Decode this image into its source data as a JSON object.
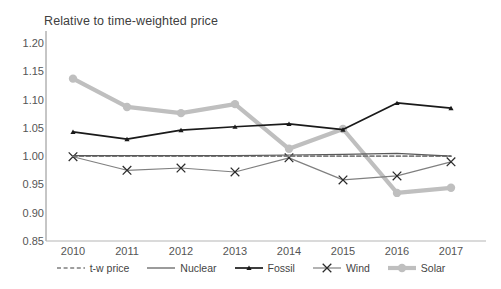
{
  "chart_data": {
    "type": "line",
    "title": "Relative to time-weighted price",
    "xlabel": "",
    "ylabel": "",
    "categories": [
      "2010",
      "2011",
      "2012",
      "2013",
      "2014",
      "2015",
      "2016",
      "2017"
    ],
    "x": [
      2010,
      2011,
      2012,
      2013,
      2014,
      2015,
      2016,
      2017
    ],
    "ylim": [
      0.85,
      1.2
    ],
    "ytick_labels": [
      "1.20",
      "1.15",
      "1.10",
      "1.05",
      "1.00",
      "0.95",
      "0.90",
      "0.85"
    ],
    "yticks": [
      1.2,
      1.15,
      1.1,
      1.05,
      1.0,
      0.95,
      0.9,
      0.85
    ],
    "grid": false,
    "legend_position": "bottom",
    "series": [
      {
        "name": "t-w price",
        "style": "dashed",
        "color": "#7f7f7f",
        "marker": "none",
        "values": [
          1.0,
          1.0,
          1.0,
          1.0,
          1.0,
          1.0,
          1.0,
          1.0
        ]
      },
      {
        "name": "Nuclear",
        "style": "solid",
        "color": "#595959",
        "marker": "none",
        "values": [
          1.001,
          1.001,
          1.001,
          1.001,
          1.002,
          1.003,
          1.005,
          1.0
        ]
      },
      {
        "name": "Fossil",
        "style": "solid-thick",
        "color": "#1a1a1a",
        "marker": "triangle",
        "values": [
          1.043,
          1.03,
          1.046,
          1.052,
          1.057,
          1.047,
          1.094,
          1.085
        ]
      },
      {
        "name": "Wind",
        "style": "solid",
        "color": "#808080",
        "marker": "x",
        "values": [
          0.999,
          0.975,
          0.979,
          0.972,
          0.997,
          0.958,
          0.965,
          0.99
        ]
      },
      {
        "name": "Solar",
        "style": "solid-extra-thick",
        "color": "#bfbfbf",
        "marker": "circle",
        "values": [
          1.137,
          1.087,
          1.076,
          1.092,
          1.013,
          1.048,
          0.935,
          0.944
        ]
      }
    ]
  },
  "legend": {
    "items": [
      {
        "label": "t-w price",
        "icon": "dashed-line-icon"
      },
      {
        "label": "Nuclear",
        "icon": "solid-line-icon"
      },
      {
        "label": "Fossil",
        "icon": "solid-line-triangle-marker-icon"
      },
      {
        "label": "Wind",
        "icon": "solid-line-x-marker-icon"
      },
      {
        "label": "Solar",
        "icon": "thick-line-circle-marker-icon"
      }
    ]
  }
}
